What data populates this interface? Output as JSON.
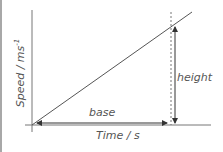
{
  "diagram": {
    "type": "speed-time graph",
    "x_axis_label": "Time / s",
    "y_axis_label_main": "Speed / ms",
    "y_axis_label_sup": "-1",
    "annotations": {
      "base_label": "base",
      "height_label": "height"
    },
    "colors": {
      "line": "#555555",
      "axis": "#777777",
      "border": "#a8a8a8",
      "text": "#555555"
    }
  }
}
